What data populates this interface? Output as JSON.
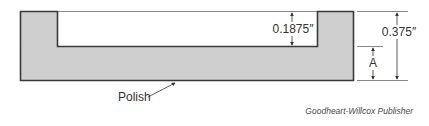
{
  "diagram": {
    "part": {
      "fill": "#cfcfcf",
      "stroke": "#3a3a3a"
    },
    "dimensions": {
      "step_depth": "0.1875″",
      "overall_height": "0.375″",
      "unknown_label": "A"
    },
    "callout": {
      "label": "Polish"
    },
    "credit": "Goodheart-Willcox Publisher"
  }
}
